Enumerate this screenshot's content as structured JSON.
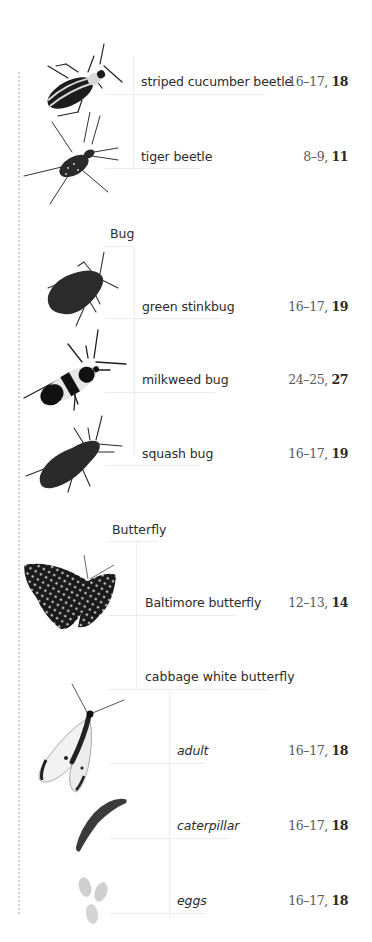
{
  "index": {
    "beetle_section": {
      "entries": [
        {
          "name": "striped cucumber beetle",
          "pages": "16–17,",
          "main_page": "18",
          "icon": "striped-cucumber-beetle-icon"
        },
        {
          "name": "tiger beetle",
          "pages": "8–9,",
          "main_page": "11",
          "icon": "tiger-beetle-icon"
        }
      ]
    },
    "bug_section": {
      "heading": "Bug",
      "entries": [
        {
          "name": "green stinkbug",
          "pages": "16–17,",
          "main_page": "19",
          "icon": "green-stinkbug-icon"
        },
        {
          "name": "milkweed bug",
          "pages": "24–25,",
          "main_page": "27",
          "icon": "milkweed-bug-icon"
        },
        {
          "name": "squash bug",
          "pages": "16–17,",
          "main_page": "19",
          "icon": "squash-bug-icon"
        }
      ]
    },
    "butterfly_section": {
      "heading": "Butterfly",
      "entries": [
        {
          "name": "Baltimore butterfly",
          "pages": "12–13,",
          "main_page": "14",
          "icon": "baltimore-butterfly-icon"
        }
      ],
      "subgroup": {
        "heading": "cabbage white butterfly",
        "entries": [
          {
            "name": "adult",
            "pages": "16–17,",
            "main_page": "18",
            "icon": "cabbage-white-adult-icon"
          },
          {
            "name": "caterpillar",
            "pages": "16–17,",
            "main_page": "18",
            "icon": "caterpillar-icon"
          },
          {
            "name": "eggs",
            "pages": "16–17,",
            "main_page": "18",
            "icon": "eggs-icon"
          }
        ]
      }
    }
  },
  "colors": {
    "text": "#2b2b2b",
    "page_numbers": "#5a5a5a",
    "tree_lines": "#eeeeee",
    "dotted_rule": "#cfcfcf"
  }
}
